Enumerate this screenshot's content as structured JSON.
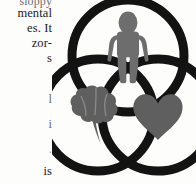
{
  "page": {
    "background_color": "#fdfdfb",
    "ink_color": "#1b1b1b"
  },
  "body_text": {
    "lines": [
      "sloppy",
      "mental",
      "es.  It",
      "zor-",
      "s",
      "l",
      "i",
      ".",
      "is"
    ]
  },
  "figure": {
    "type": "venn-diagram",
    "stroke_color": "#131313",
    "icon_color": "#6d6d6d",
    "circle_count": 3,
    "circles": [
      {
        "id": "top",
        "label": "person",
        "icon": "person-icon",
        "cx": 76,
        "cy": 62,
        "r": 56
      },
      {
        "id": "bottom-left",
        "label": "brain",
        "icon": "brain-icon",
        "cx": 46,
        "cy": 121,
        "r": 56
      },
      {
        "id": "bottom-right",
        "label": "heart",
        "icon": "heart-icon",
        "cx": 106,
        "cy": 121,
        "r": 56
      }
    ]
  }
}
